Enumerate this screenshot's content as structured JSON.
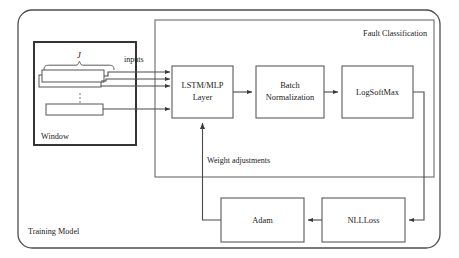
{
  "figure": {
    "type": "block-diagram",
    "width": 459,
    "height": 258,
    "background": "#ffffff",
    "line_color": "#4a4a4a",
    "text_color": "#1a1a1a"
  },
  "containers": [
    {
      "id": "training-model",
      "label": "Training Model",
      "shape": "rounded-rectangle",
      "x": 18,
      "y": 10,
      "width": 422,
      "height": 238,
      "radius": 14,
      "label_x": 28,
      "label_y": 234
    },
    {
      "id": "fault-classification",
      "label": "Fault Classification",
      "shape": "rectangle",
      "x": 155,
      "y": 20,
      "width": 279,
      "height": 157,
      "label_x": 427,
      "label_y": 36
    },
    {
      "id": "window",
      "label": "Window",
      "shape": "rectangle",
      "x": 34,
      "y": 42,
      "width": 102,
      "height": 103,
      "label_x": 41,
      "label_y": 139
    }
  ],
  "nodes": [
    {
      "id": "lstm-mlp-layer",
      "label_lines": [
        "LSTM/MLP",
        "Layer"
      ],
      "x": 172,
      "y": 66,
      "width": 61,
      "height": 52
    },
    {
      "id": "batch-normalization",
      "label_lines": [
        "Batch",
        "Normalization"
      ],
      "x": 256,
      "y": 66,
      "width": 68,
      "height": 52
    },
    {
      "id": "logsoftmax",
      "label_lines": [
        "LogSoftMax"
      ],
      "x": 342,
      "y": 66,
      "width": 71,
      "height": 52
    },
    {
      "id": "adam",
      "label_lines": [
        "Adam"
      ],
      "x": 221,
      "y": 198,
      "width": 83,
      "height": 44
    },
    {
      "id": "nllloss",
      "label_lines": [
        "NLLLoss"
      ],
      "x": 322,
      "y": 198,
      "width": 83,
      "height": 44
    }
  ],
  "window_contents": {
    "brace_label": "J",
    "brace_label_x": 79,
    "brace_label_y": 58,
    "ellipsis_x": 80,
    "ellipsis_y_values": [
      96,
      100,
      104
    ],
    "stack_rects": [
      {
        "id": "window-row-1",
        "x": 42,
        "y": 70,
        "width": 62,
        "height": 12
      },
      {
        "id": "window-row-2",
        "x": 39,
        "y": 75,
        "width": 62,
        "height": 12
      },
      {
        "id": "window-row-3",
        "x": 46,
        "y": 104,
        "width": 57,
        "height": 11
      }
    ]
  },
  "edges": [
    {
      "id": "inputs-edge",
      "label": "inputs",
      "label_x": 124,
      "label_y": 62,
      "from": "window",
      "to": "lstm-mlp-layer"
    },
    {
      "id": "lstm-to-batchnorm",
      "label": "",
      "from": "lstm-mlp-layer",
      "to": "batch-normalization"
    },
    {
      "id": "batchnorm-to-logsoftmax",
      "label": "",
      "from": "batch-normalization",
      "to": "logsoftmax"
    },
    {
      "id": "logsoftmax-to-nllloss",
      "label": "",
      "from": "logsoftmax",
      "to": "nllloss"
    },
    {
      "id": "nllloss-to-adam",
      "label": "",
      "from": "nllloss",
      "to": "adam"
    },
    {
      "id": "adam-to-lstm",
      "label": "Weight adjustments",
      "label_x": 207,
      "label_y": 163,
      "from": "adam",
      "to": "lstm-mlp-layer"
    }
  ]
}
